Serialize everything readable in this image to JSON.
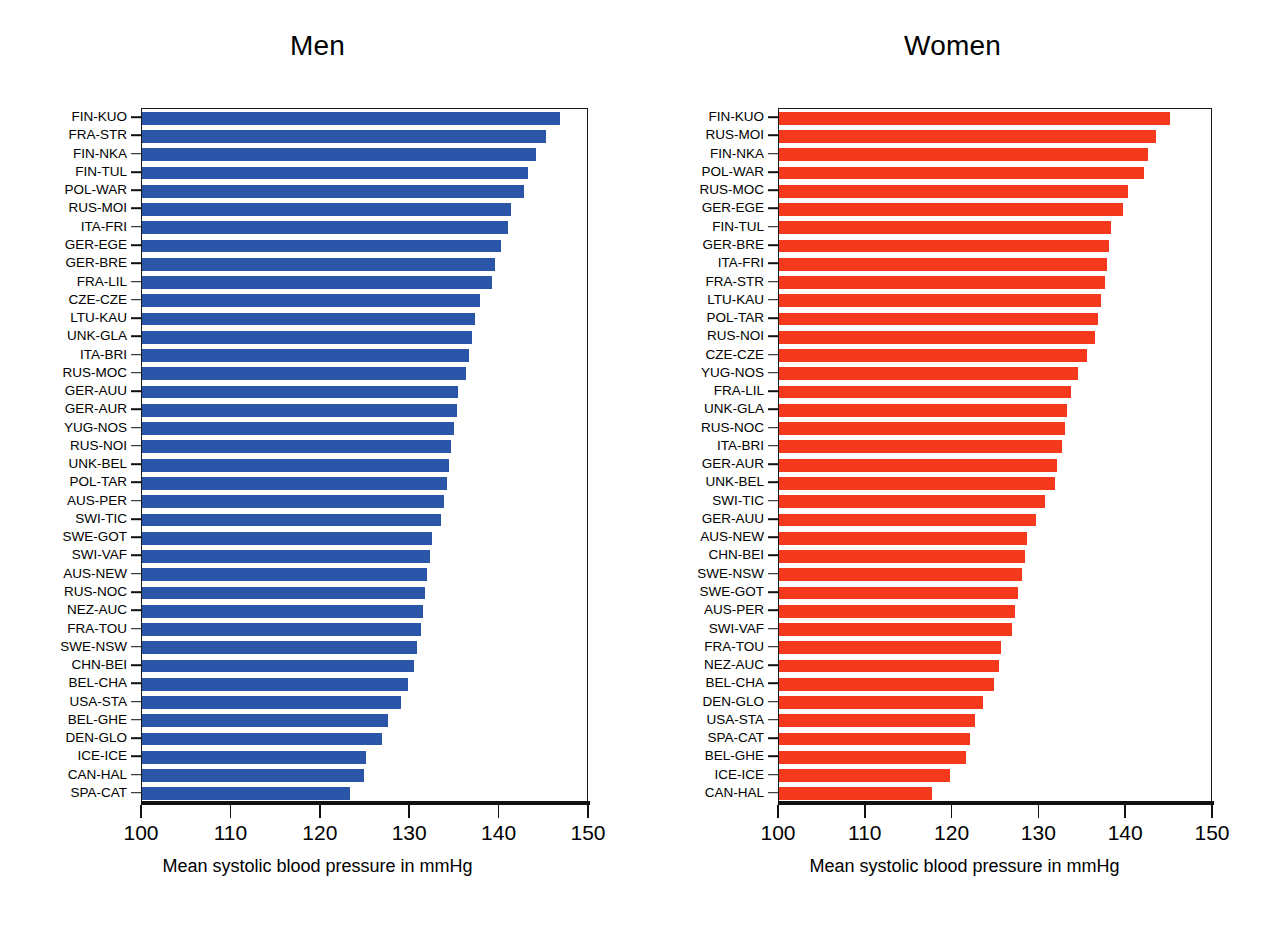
{
  "figure": {
    "background": "#ffffff",
    "men_color": "#2b55a8",
    "women_color": "#f4391d"
  },
  "panels": {
    "men": {
      "title": "Men",
      "xlabel": "Mean systolic blood pressure in mmHg",
      "xticks": [
        "100",
        "110",
        "120",
        "130",
        "140",
        "150"
      ]
    },
    "women": {
      "title": "Women",
      "xlabel": "Mean systolic blood pressure in mmHg",
      "xticks": [
        "100",
        "110",
        "120",
        "130",
        "140",
        "150"
      ]
    }
  },
  "chart_data": [
    {
      "type": "bar",
      "orientation": "horizontal",
      "title": "Men",
      "xlabel": "Mean systolic blood pressure in mmHg",
      "ylabel": "",
      "xlim": [
        100,
        150
      ],
      "xticks": [
        100,
        110,
        120,
        130,
        140,
        150
      ],
      "grid": false,
      "legend": "none",
      "color": "#2b55a8",
      "categories": [
        "FIN-KUO",
        "FRA-STR",
        "FIN-NKA",
        "FIN-TUL",
        "POL-WAR",
        "RUS-MOI",
        "ITA-FRI",
        "GER-EGE",
        "GER-BRE",
        "FRA-LIL",
        "CZE-CZE",
        "LTU-KAU",
        "UNK-GLA",
        "ITA-BRI",
        "RUS-MOC",
        "GER-AUU",
        "GER-AUR",
        "YUG-NOS",
        "RUS-NOI",
        "UNK-BEL",
        "POL-TAR",
        "AUS-PER",
        "SWI-TIC",
        "SWE-GOT",
        "SWI-VAF",
        "AUS-NEW",
        "RUS-NOC",
        "NEZ-AUC",
        "FRA-TOU",
        "SWE-NSW",
        "CHN-BEI",
        "BEL-CHA",
        "USA-STA",
        "BEL-GHE",
        "DEN-GLO",
        "ICE-ICE",
        "CAN-HAL",
        "SPA-CAT"
      ],
      "values": [
        146.8,
        145.2,
        144.1,
        143.2,
        142.7,
        141.3,
        140.9,
        140.2,
        139.5,
        139.2,
        137.8,
        137.2,
        136.9,
        136.6,
        136.2,
        135.4,
        135.2,
        134.9,
        134.6,
        134.3,
        134.1,
        133.8,
        133.4,
        132.4,
        132.2,
        131.9,
        131.7,
        131.4,
        131.2,
        130.8,
        130.4,
        129.8,
        129.0,
        127.5,
        126.8,
        125.0,
        124.8,
        123.3
      ]
    },
    {
      "type": "bar",
      "orientation": "horizontal",
      "title": "Women",
      "xlabel": "Mean systolic blood pressure in mmHg",
      "ylabel": "",
      "xlim": [
        100,
        150
      ],
      "xticks": [
        100,
        110,
        120,
        130,
        140,
        150
      ],
      "grid": false,
      "legend": "none",
      "color": "#f4391d",
      "categories": [
        "FIN-KUO",
        "RUS-MOI",
        "FIN-NKA",
        "POL-WAR",
        "RUS-MOC",
        "GER-EGE",
        "FIN-TUL",
        "GER-BRE",
        "ITA-FRI",
        "FRA-STR",
        "LTU-KAU",
        "POL-TAR",
        "RUS-NOI",
        "CZE-CZE",
        "YUG-NOS",
        "FRA-LIL",
        "UNK-GLA",
        "RUS-NOC",
        "ITA-BRI",
        "GER-AUR",
        "UNK-BEL",
        "SWI-TIC",
        "GER-AUU",
        "AUS-NEW",
        "CHN-BEI",
        "SWE-NSW",
        "SWE-GOT",
        "AUS-PER",
        "SWI-VAF",
        "FRA-TOU",
        "NEZ-AUC",
        "BEL-CHA",
        "DEN-GLO",
        "USA-STA",
        "SPA-CAT",
        "BEL-GHE",
        "ICE-ICE",
        "CAN-HAL"
      ],
      "values": [
        145.0,
        143.4,
        142.5,
        142.0,
        140.2,
        139.6,
        138.2,
        138.0,
        137.8,
        137.6,
        137.1,
        136.8,
        136.4,
        135.5,
        134.5,
        133.6,
        133.2,
        132.9,
        132.6,
        132.0,
        131.8,
        130.6,
        129.6,
        128.6,
        128.3,
        128.0,
        127.5,
        127.2,
        126.8,
        125.6,
        125.3,
        124.8,
        123.5,
        122.6,
        122.0,
        121.5,
        119.7,
        117.6
      ]
    }
  ]
}
